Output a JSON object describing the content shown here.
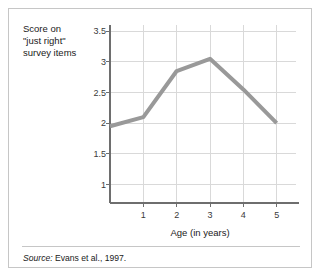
{
  "figure": {
    "y_axis_caption_lines": [
      "Score on",
      "\"just right\"",
      "survey items"
    ],
    "x_axis_title": "Age (in years)",
    "source_label": "Source:",
    "source_text": " Evans et al., 1997."
  },
  "colors": {
    "frame_border": "#c6c6c6",
    "gridline": "#d9d9d9",
    "axis": "#6e6e6e",
    "series_line": "#999999",
    "tick_text": "#3a3a3a",
    "body_text": "#1a1a1a",
    "background": "#ffffff"
  },
  "chart_data": {
    "type": "line",
    "title": "",
    "xlabel": "Age (in years)",
    "ylabel": "Score on \"just right\" survey items",
    "x": [
      0,
      1,
      2,
      3,
      4,
      5
    ],
    "values": [
      1.95,
      2.1,
      2.85,
      3.05,
      2.55,
      2.0
    ],
    "series": [
      {
        "name": "Score on \"just right\" survey items",
        "values": [
          1.95,
          2.1,
          2.85,
          3.05,
          2.55,
          2.0
        ]
      }
    ],
    "xlim": [
      0,
      5.4
    ],
    "ylim": [
      0.7,
      3.6
    ],
    "xticks": [
      1,
      2,
      3,
      4,
      5
    ],
    "xtick_labels": [
      "1",
      "2",
      "3",
      "4",
      "5"
    ],
    "yticks": [
      1,
      1.5,
      2,
      2.5,
      3,
      3.5
    ],
    "ytick_labels": [
      "1",
      "1.5",
      "2",
      "2.5",
      "3",
      "3.5"
    ],
    "grid": true,
    "legend": false,
    "line_width": 4,
    "markers": false
  }
}
